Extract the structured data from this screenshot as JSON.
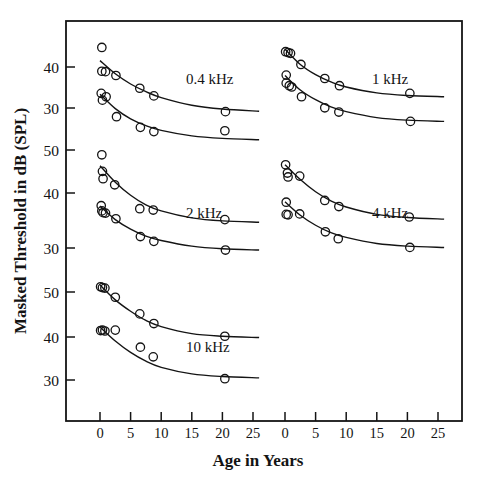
{
  "figure": {
    "ylabel": "Masked Threshold in dB (SPL)",
    "xlabel": "Age in Years"
  },
  "axis": {
    "x_ticks": [
      "0",
      "5",
      "10",
      "15",
      "20",
      "25"
    ],
    "x_ticks_right": [
      "0",
      "5",
      "10",
      "15",
      "20",
      "25"
    ],
    "y_ticks": [
      "40",
      "30",
      "50",
      "40",
      "30",
      "50",
      "40",
      "30"
    ]
  },
  "panel_labels": {
    "p04": "0.4  kHz",
    "p1": "1  kHz",
    "p2": "2  kHz",
    "p4": "4  kHz",
    "p10": "10  kHz"
  },
  "chart_data": {
    "type": "scatter",
    "title": "",
    "xlabel": "Age in Years",
    "ylabel": "Masked Threshold in dB (SPL)",
    "grid": false,
    "legend": null,
    "marker": "open-circle",
    "xlim": [
      -2,
      27
    ],
    "panels": [
      {
        "id": "0.4kHz-panel",
        "label": "0.4  kHz",
        "row": 0,
        "col": 0,
        "ylim": [
          26,
          46
        ],
        "yticks": [
          40,
          30
        ],
        "series": [
          {
            "name": "0.4 kHz upper",
            "points": [
              {
                "x": 0.3,
                "y": 44.6
              },
              {
                "x": 0.3,
                "y": 39.0
              },
              {
                "x": 0.9,
                "y": 38.9
              },
              {
                "x": 2.6,
                "y": 38.0
              },
              {
                "x": 6.5,
                "y": 35.0
              },
              {
                "x": 8.8,
                "y": 33.2
              },
              {
                "x": 20.5,
                "y": 29.5
              }
            ],
            "fit": [
              {
                "x": 0.0,
                "y": 41.5
              },
              {
                "x": 2.5,
                "y": 38.4
              },
              {
                "x": 5.0,
                "y": 36.0
              },
              {
                "x": 7.5,
                "y": 34.2
              },
              {
                "x": 10.0,
                "y": 32.8
              },
              {
                "x": 15.0,
                "y": 31.0
              },
              {
                "x": 20.0,
                "y": 30.1
              },
              {
                "x": 26.0,
                "y": 29.6
              }
            ]
          },
          {
            "name": "0.4 kHz lower",
            "points": [
              {
                "x": 0.2,
                "y": 33.8
              },
              {
                "x": 0.4,
                "y": 32.2
              },
              {
                "x": 1.0,
                "y": 33.0
              },
              {
                "x": 2.7,
                "y": 28.3
              },
              {
                "x": 6.6,
                "y": 25.8
              },
              {
                "x": 8.8,
                "y": 24.8
              },
              {
                "x": 20.4,
                "y": 25.0
              }
            ],
            "fit": [
              {
                "x": 0.0,
                "y": 33.6
              },
              {
                "x": 2.5,
                "y": 30.2
              },
              {
                "x": 5.0,
                "y": 27.8
              },
              {
                "x": 7.5,
                "y": 26.2
              },
              {
                "x": 10.0,
                "y": 25.1
              },
              {
                "x": 15.0,
                "y": 23.8
              },
              {
                "x": 20.0,
                "y": 23.2
              },
              {
                "x": 26.0,
                "y": 22.9
              }
            ]
          }
        ]
      },
      {
        "id": "1kHz-panel",
        "label": "1  kHz",
        "row": 0,
        "col": 1,
        "ylim": [
          26,
          46
        ],
        "yticks": [
          40,
          30
        ],
        "series": [
          {
            "name": "1 kHz upper",
            "points": [
              {
                "x": 0.1,
                "y": 43.6
              },
              {
                "x": 0.5,
                "y": 43.4
              },
              {
                "x": 0.9,
                "y": 43.2
              },
              {
                "x": 2.6,
                "y": 40.6
              },
              {
                "x": 6.5,
                "y": 37.3
              },
              {
                "x": 8.9,
                "y": 35.6
              },
              {
                "x": 20.4,
                "y": 33.8
              }
            ],
            "fit": [
              {
                "x": 0.0,
                "y": 44.2
              },
              {
                "x": 2.5,
                "y": 40.6
              },
              {
                "x": 5.0,
                "y": 38.2
              },
              {
                "x": 7.5,
                "y": 36.5
              },
              {
                "x": 10.0,
                "y": 35.3
              },
              {
                "x": 15.0,
                "y": 33.9
              },
              {
                "x": 20.0,
                "y": 33.3
              },
              {
                "x": 26.0,
                "y": 33.0
              }
            ]
          },
          {
            "name": "1 kHz lower",
            "points": [
              {
                "x": 0.2,
                "y": 38.1
              },
              {
                "x": 0.2,
                "y": 36.2
              },
              {
                "x": 0.7,
                "y": 35.6
              },
              {
                "x": 1.1,
                "y": 35.3
              },
              {
                "x": 2.7,
                "y": 33.0
              },
              {
                "x": 6.5,
                "y": 30.4
              },
              {
                "x": 8.8,
                "y": 29.4
              },
              {
                "x": 20.5,
                "y": 27.2
              }
            ],
            "fit": [
              {
                "x": 0.0,
                "y": 38.0
              },
              {
                "x": 2.5,
                "y": 34.6
              },
              {
                "x": 5.0,
                "y": 32.3
              },
              {
                "x": 7.5,
                "y": 30.6
              },
              {
                "x": 10.0,
                "y": 29.5
              },
              {
                "x": 15.0,
                "y": 28.1
              },
              {
                "x": 20.0,
                "y": 27.5
              },
              {
                "x": 26.0,
                "y": 27.2
              }
            ]
          }
        ]
      },
      {
        "id": "2kHz-panel",
        "label": "2  kHz",
        "row": 1,
        "col": 0,
        "ylim": [
          26,
          52
        ],
        "yticks": [
          50,
          40,
          30
        ],
        "series": [
          {
            "name": "2 kHz upper",
            "points": [
              {
                "x": 0.3,
                "y": 48.9
              },
              {
                "x": 0.4,
                "y": 45.1
              },
              {
                "x": 0.5,
                "y": 43.4
              },
              {
                "x": 2.4,
                "y": 42.0
              },
              {
                "x": 6.5,
                "y": 36.5
              },
              {
                "x": 8.7,
                "y": 36.2
              },
              {
                "x": 20.4,
                "y": 34.0
              }
            ],
            "fit": [
              {
                "x": 0.0,
                "y": 46.4
              },
              {
                "x": 2.5,
                "y": 42.6
              },
              {
                "x": 5.0,
                "y": 39.6
              },
              {
                "x": 7.5,
                "y": 37.4
              },
              {
                "x": 10.0,
                "y": 36.0
              },
              {
                "x": 15.0,
                "y": 34.4
              },
              {
                "x": 20.0,
                "y": 33.7
              },
              {
                "x": 26.0,
                "y": 33.4
              }
            ]
          },
          {
            "name": "2 kHz lower",
            "points": [
              {
                "x": 0.2,
                "y": 37.2
              },
              {
                "x": 0.3,
                "y": 36.0
              },
              {
                "x": 0.5,
                "y": 35.6
              },
              {
                "x": 0.9,
                "y": 35.5
              },
              {
                "x": 2.6,
                "y": 34.2
              },
              {
                "x": 6.6,
                "y": 30.1
              },
              {
                "x": 8.8,
                "y": 29.0
              },
              {
                "x": 20.5,
                "y": 27.0
              }
            ],
            "fit": [
              {
                "x": 0.0,
                "y": 37.1
              },
              {
                "x": 2.5,
                "y": 34.0
              },
              {
                "x": 5.0,
                "y": 31.8
              },
              {
                "x": 7.5,
                "y": 30.2
              },
              {
                "x": 10.0,
                "y": 29.2
              },
              {
                "x": 15.0,
                "y": 27.9
              },
              {
                "x": 20.0,
                "y": 27.3
              },
              {
                "x": 26.0,
                "y": 27.0
              }
            ]
          }
        ]
      },
      {
        "id": "4kHz-panel",
        "label": "4  kHz",
        "row": 1,
        "col": 1,
        "ylim": [
          26,
          52
        ],
        "yticks": [
          50,
          40,
          30
        ],
        "series": [
          {
            "name": "4 kHz upper",
            "points": [
              {
                "x": 0.1,
                "y": 46.6
              },
              {
                "x": 0.4,
                "y": 44.7
              },
              {
                "x": 0.5,
                "y": 43.8
              },
              {
                "x": 2.4,
                "y": 44.0
              },
              {
                "x": 6.5,
                "y": 38.4
              },
              {
                "x": 8.8,
                "y": 37.0
              },
              {
                "x": 20.3,
                "y": 34.6
              }
            ],
            "fit": [
              {
                "x": 0.0,
                "y": 46.6
              },
              {
                "x": 2.5,
                "y": 43.2
              },
              {
                "x": 5.0,
                "y": 40.4
              },
              {
                "x": 7.5,
                "y": 38.3
              },
              {
                "x": 10.0,
                "y": 36.9
              },
              {
                "x": 15.0,
                "y": 35.2
              },
              {
                "x": 20.0,
                "y": 34.5
              },
              {
                "x": 26.0,
                "y": 34.1
              }
            ]
          },
          {
            "name": "4 kHz lower",
            "points": [
              {
                "x": 0.2,
                "y": 38.0
              },
              {
                "x": 0.2,
                "y": 35.2
              },
              {
                "x": 0.5,
                "y": 35.1
              },
              {
                "x": 2.4,
                "y": 35.3
              },
              {
                "x": 6.6,
                "y": 31.2
              },
              {
                "x": 8.7,
                "y": 29.6
              },
              {
                "x": 20.4,
                "y": 27.6
              }
            ],
            "fit": [
              {
                "x": 0.0,
                "y": 38.1
              },
              {
                "x": 2.5,
                "y": 35.0
              },
              {
                "x": 5.0,
                "y": 32.7
              },
              {
                "x": 7.5,
                "y": 31.0
              },
              {
                "x": 10.0,
                "y": 29.9
              },
              {
                "x": 15.0,
                "y": 28.5
              },
              {
                "x": 20.0,
                "y": 27.9
              },
              {
                "x": 26.0,
                "y": 27.6
              }
            ]
          }
        ]
      },
      {
        "id": "10kHz-panel",
        "label": "10  kHz",
        "row": 2,
        "col": 0,
        "ylim": [
          26,
          52
        ],
        "yticks": [
          50,
          40,
          30
        ],
        "series": [
          {
            "name": "10 kHz upper",
            "points": [
              {
                "x": 0.1,
                "y": 51.2
              },
              {
                "x": 0.4,
                "y": 51.0
              },
              {
                "x": 0.8,
                "y": 50.9
              },
              {
                "x": 2.5,
                "y": 48.8
              },
              {
                "x": 6.5,
                "y": 45.0
              },
              {
                "x": 8.8,
                "y": 42.8
              },
              {
                "x": 20.4,
                "y": 39.9
              }
            ],
            "fit": [
              {
                "x": 0.0,
                "y": 51.6
              },
              {
                "x": 2.5,
                "y": 48.2
              },
              {
                "x": 5.0,
                "y": 45.6
              },
              {
                "x": 7.5,
                "y": 43.5
              },
              {
                "x": 10.0,
                "y": 42.1
              },
              {
                "x": 15.0,
                "y": 40.5
              },
              {
                "x": 20.0,
                "y": 39.9
              },
              {
                "x": 26.0,
                "y": 39.6
              }
            ]
          },
          {
            "name": "10 kHz lower",
            "points": [
              {
                "x": 0.1,
                "y": 41.2
              },
              {
                "x": 0.4,
                "y": 41.3
              },
              {
                "x": 0.8,
                "y": 41.1
              },
              {
                "x": 2.5,
                "y": 41.3
              },
              {
                "x": 6.6,
                "y": 37.4
              },
              {
                "x": 8.7,
                "y": 35.2
              },
              {
                "x": 20.4,
                "y": 30.2
              }
            ],
            "fit": [
              {
                "x": 0.0,
                "y": 42.0
              },
              {
                "x": 2.5,
                "y": 38.8
              },
              {
                "x": 5.0,
                "y": 36.2
              },
              {
                "x": 7.5,
                "y": 34.2
              },
              {
                "x": 10.0,
                "y": 32.8
              },
              {
                "x": 15.0,
                "y": 31.3
              },
              {
                "x": 20.0,
                "y": 30.7
              },
              {
                "x": 26.0,
                "y": 30.4
              }
            ]
          }
        ]
      }
    ]
  }
}
